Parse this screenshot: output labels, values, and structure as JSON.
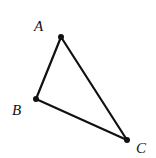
{
  "diagram": {
    "type": "triangle",
    "stroke_color": "#111111",
    "points": [
      {
        "label": "A",
        "x": 61,
        "y": 37,
        "label_x": 34,
        "label_y": 31
      },
      {
        "label": "B",
        "x": 36,
        "y": 99,
        "label_x": 12,
        "label_y": 115
      },
      {
        "label": "C",
        "x": 127,
        "y": 140,
        "label_x": 136,
        "label_y": 153
      }
    ],
    "edges": [
      [
        "A",
        "B"
      ],
      [
        "B",
        "C"
      ],
      [
        "C",
        "A"
      ]
    ]
  }
}
